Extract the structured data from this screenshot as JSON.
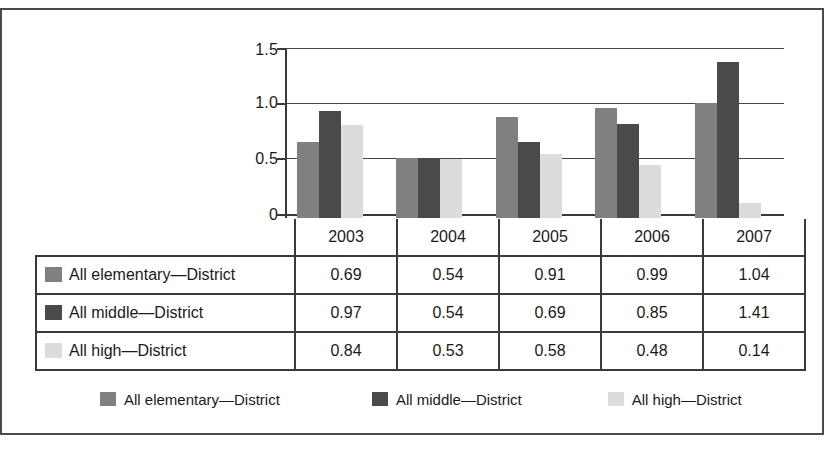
{
  "chart_data": {
    "type": "bar",
    "title": "",
    "subtitle": "",
    "xlabel": "",
    "ylabel": "",
    "categories": [
      "2003",
      "2004",
      "2005",
      "2006",
      "2007"
    ],
    "series": [
      {
        "name": "All elementary—District",
        "color": "#808080",
        "values": [
          0.69,
          0.54,
          0.91,
          0.99,
          1.04
        ]
      },
      {
        "name": "All middle—District",
        "color": "#4a4a4a",
        "values": [
          0.97,
          0.54,
          0.69,
          0.85,
          1.41
        ]
      },
      {
        "name": "All high—District",
        "color": "#dcdcdc",
        "values": [
          0.84,
          0.53,
          0.58,
          0.48,
          0.14
        ]
      }
    ],
    "ylim": [
      0,
      1.5
    ],
    "yticks": [
      "0",
      "0.5",
      "1.0",
      "1.5"
    ],
    "ytick_values": [
      0,
      0.5,
      1.0,
      1.5
    ],
    "grid": true,
    "legend_position": "bottom",
    "data_table_shown": true
  },
  "table": {
    "header": [
      "",
      "2003",
      "2004",
      "2005",
      "2006",
      "2007"
    ],
    "rows": [
      {
        "label": "All elementary—District",
        "swatch": "#808080",
        "values": [
          "0.69",
          "0.54",
          "0.91",
          "0.99",
          "1.04"
        ]
      },
      {
        "label": "All middle—District",
        "swatch": "#4a4a4a",
        "values": [
          "0.97",
          "0.54",
          "0.69",
          "0.85",
          "1.41"
        ]
      },
      {
        "label": "All high—District",
        "swatch": "#dcdcdc",
        "values": [
          "0.84",
          "0.53",
          "0.58",
          "0.48",
          "0.14"
        ]
      }
    ]
  },
  "legend": {
    "items": [
      {
        "label": "All elementary—District",
        "color": "#808080"
      },
      {
        "label": "All middle—District",
        "color": "#4a4a4a"
      },
      {
        "label": "All high—District",
        "color": "#dcdcdc"
      }
    ]
  },
  "axis": {
    "y_labels": [
      "1.5",
      "1.0",
      "0.5",
      "0"
    ]
  }
}
